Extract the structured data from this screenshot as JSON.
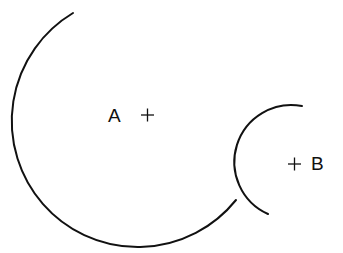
{
  "diagram": {
    "type": "two-circle-arcs",
    "background": "#ffffff",
    "stroke_color": "#111111",
    "circles": [
      {
        "id": "A",
        "label": "A",
        "center_marker": "plus-icon",
        "center": [
          147,
          116
        ],
        "radius": 126,
        "arc_start": [
          73,
          13
        ],
        "arc_end": [
          236,
          200
        ]
      },
      {
        "id": "B",
        "label": "B",
        "center_marker": "plus-icon",
        "center": [
          295,
          163
        ],
        "radius": 57,
        "arc_start": [
          302,
          105
        ],
        "arc_end": [
          268,
          214
        ]
      }
    ]
  }
}
